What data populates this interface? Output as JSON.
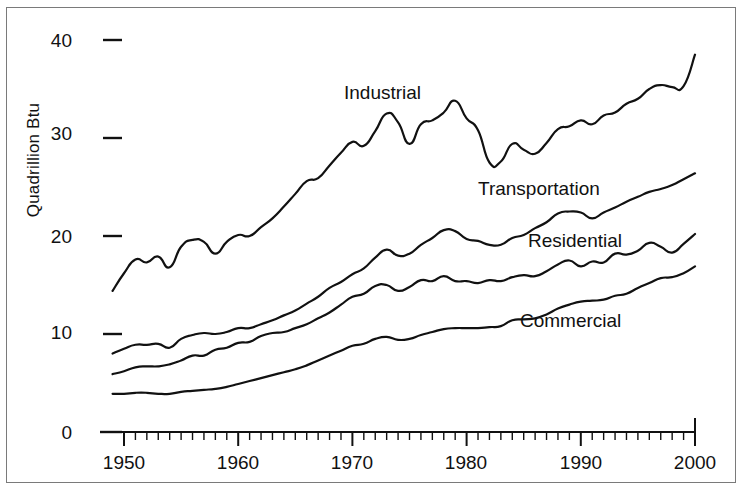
{
  "figure": {
    "background": "#ffffff",
    "line_color": "#111111",
    "frame_color": "#7a7a7a"
  },
  "axes": {
    "y_label": "Quadrillion Btu",
    "y_ticks": [
      "0",
      "10",
      "20",
      "30",
      "40"
    ],
    "x_ticks": [
      "1950",
      "1960",
      "1970",
      "1980",
      "1990",
      "2000"
    ]
  },
  "series_labels": {
    "industrial": "Industrial",
    "transportation": "Transportation",
    "residential": "Residential",
    "commercial": "Commercial"
  },
  "chart_data": {
    "type": "line",
    "title": "",
    "xlabel": "",
    "ylabel": "Quadrillion Btu",
    "xlim": [
      1949,
      2000
    ],
    "ylim": [
      0,
      42
    ],
    "yticks": [
      0,
      10,
      20,
      30,
      40
    ],
    "xticks": [
      1950,
      1960,
      1970,
      1980,
      1990,
      2000
    ],
    "minor_xticks_every": 1,
    "grid": false,
    "legend": "inline-labels",
    "x": [
      1949,
      1950,
      1951,
      1952,
      1953,
      1954,
      1955,
      1956,
      1957,
      1958,
      1959,
      1960,
      1961,
      1962,
      1963,
      1964,
      1965,
      1966,
      1967,
      1968,
      1969,
      1970,
      1971,
      1972,
      1973,
      1974,
      1975,
      1976,
      1977,
      1978,
      1979,
      1980,
      1981,
      1982,
      1983,
      1984,
      1985,
      1986,
      1987,
      1988,
      1989,
      1990,
      1991,
      1992,
      1993,
      1994,
      1995,
      1996,
      1997,
      1998,
      1999,
      2000
    ],
    "series": [
      {
        "name": "Industrial",
        "values": [
          14.4,
          16.2,
          17.6,
          17.3,
          17.9,
          16.8,
          18.9,
          19.6,
          19.4,
          18.2,
          19.4,
          20.1,
          20.0,
          20.9,
          21.8,
          23.0,
          24.3,
          25.6,
          25.9,
          27.2,
          28.5,
          29.6,
          29.2,
          30.7,
          32.5,
          31.6,
          29.4,
          31.4,
          31.8,
          32.6,
          33.8,
          32.0,
          30.8,
          27.5,
          27.6,
          29.4,
          28.8,
          28.4,
          29.5,
          30.9,
          31.2,
          31.8,
          31.4,
          32.3,
          32.6,
          33.5,
          34.0,
          35.0,
          35.4,
          35.2,
          35.3,
          38.5
        ]
      },
      {
        "name": "Transportation",
        "values": [
          8.0,
          8.5,
          8.9,
          8.9,
          9.0,
          8.6,
          9.5,
          9.9,
          10.1,
          10.0,
          10.2,
          10.6,
          10.6,
          11.0,
          11.4,
          11.9,
          12.4,
          13.1,
          13.8,
          14.7,
          15.3,
          16.1,
          16.7,
          17.8,
          18.6,
          18.0,
          18.2,
          19.1,
          19.8,
          20.6,
          20.5,
          19.7,
          19.5,
          19.1,
          19.1,
          19.8,
          20.1,
          20.8,
          21.4,
          22.3,
          22.5,
          22.4,
          21.8,
          22.4,
          22.9,
          23.5,
          24.0,
          24.5,
          24.8,
          25.2,
          25.8,
          26.4
        ]
      },
      {
        "name": "Residential",
        "values": [
          5.9,
          6.2,
          6.6,
          6.7,
          6.7,
          6.9,
          7.3,
          7.8,
          7.8,
          8.4,
          8.6,
          9.1,
          9.2,
          9.8,
          10.1,
          10.2,
          10.6,
          11.0,
          11.6,
          12.2,
          13.0,
          13.8,
          14.1,
          14.9,
          15.0,
          14.4,
          14.8,
          15.5,
          15.4,
          15.9,
          15.4,
          15.4,
          15.2,
          15.5,
          15.4,
          15.8,
          16.0,
          15.9,
          16.4,
          17.1,
          17.5,
          16.9,
          17.4,
          17.3,
          18.2,
          18.1,
          18.5,
          19.3,
          18.9,
          18.3,
          19.2,
          20.2
        ]
      },
      {
        "name": "Commercial",
        "values": [
          3.9,
          3.9,
          4.0,
          4.0,
          3.9,
          3.9,
          4.1,
          4.2,
          4.3,
          4.4,
          4.6,
          4.9,
          5.2,
          5.5,
          5.8,
          6.1,
          6.4,
          6.8,
          7.3,
          7.8,
          8.3,
          8.8,
          9.0,
          9.5,
          9.7,
          9.4,
          9.5,
          9.9,
          10.2,
          10.5,
          10.6,
          10.6,
          10.6,
          10.7,
          10.8,
          11.4,
          11.5,
          11.6,
          12.0,
          12.6,
          13.0,
          13.3,
          13.4,
          13.5,
          13.9,
          14.1,
          14.7,
          15.2,
          15.7,
          15.8,
          16.2,
          16.9
        ]
      }
    ]
  }
}
